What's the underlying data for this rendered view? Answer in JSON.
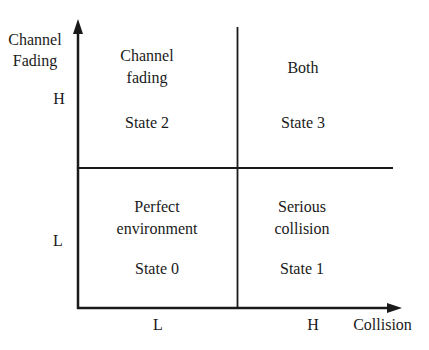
{
  "y_axis": {
    "title_line1": "Channel",
    "title_line2": "Fading",
    "high": "H",
    "low": "L"
  },
  "x_axis": {
    "title": "Collision",
    "low": "L",
    "high": "H"
  },
  "quadrants": {
    "top_left": {
      "line1": "Channel",
      "line2": "fading",
      "state": "State 2"
    },
    "top_right": {
      "line1": "Both",
      "state": "State 3"
    },
    "bottom_left": {
      "line1": "Perfect",
      "line2": "environment",
      "state": "State 0"
    },
    "bottom_right": {
      "line1": "Serious",
      "line2": "collision",
      "state": "State 1"
    }
  }
}
